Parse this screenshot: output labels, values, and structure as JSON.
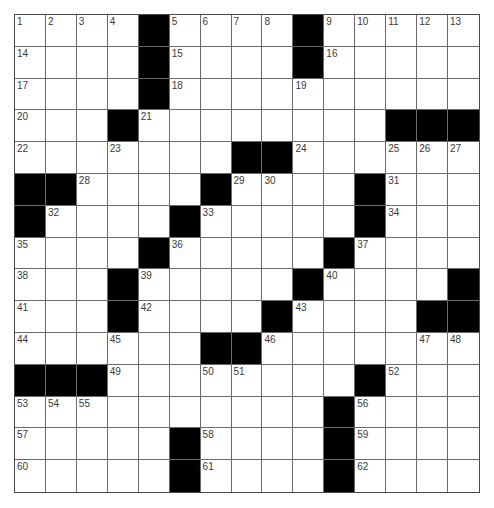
{
  "puzzle": {
    "type": "crossword",
    "size": {
      "rows": 15,
      "cols": 15
    },
    "colors": {
      "block": "#000000",
      "cell": "#ffffff",
      "gridline": "#6b6b6b",
      "number": "#3a3a3a"
    },
    "layout": [
      "....#....#.....",
      "....#....#.....",
      "....#..........",
      "...#........###",
      ".......##......",
      "##....#....#...",
      "#....#.....#...",
      "....#.....#....",
      "...#.....#....#",
      "...#....#....##",
      "......##.......",
      "###........#...",
      "..........#....",
      ".....#....#....",
      ".....#....#...."
    ],
    "numbers": [
      {
        "row": 0,
        "col": 0,
        "n": "1"
      },
      {
        "row": 0,
        "col": 1,
        "n": "2"
      },
      {
        "row": 0,
        "col": 2,
        "n": "3"
      },
      {
        "row": 0,
        "col": 3,
        "n": "4"
      },
      {
        "row": 0,
        "col": 5,
        "n": "5"
      },
      {
        "row": 0,
        "col": 6,
        "n": "6"
      },
      {
        "row": 0,
        "col": 7,
        "n": "7"
      },
      {
        "row": 0,
        "col": 8,
        "n": "8"
      },
      {
        "row": 0,
        "col": 10,
        "n": "9"
      },
      {
        "row": 0,
        "col": 11,
        "n": "10"
      },
      {
        "row": 0,
        "col": 12,
        "n": "11"
      },
      {
        "row": 0,
        "col": 13,
        "n": "12"
      },
      {
        "row": 0,
        "col": 14,
        "n": "13"
      },
      {
        "row": 1,
        "col": 0,
        "n": "14"
      },
      {
        "row": 1,
        "col": 5,
        "n": "15"
      },
      {
        "row": 1,
        "col": 10,
        "n": "16"
      },
      {
        "row": 2,
        "col": 0,
        "n": "17"
      },
      {
        "row": 2,
        "col": 5,
        "n": "18"
      },
      {
        "row": 2,
        "col": 9,
        "n": "19"
      },
      {
        "row": 3,
        "col": 0,
        "n": "20"
      },
      {
        "row": 3,
        "col": 4,
        "n": "21"
      },
      {
        "row": 4,
        "col": 0,
        "n": "22"
      },
      {
        "row": 4,
        "col": 3,
        "n": "23"
      },
      {
        "row": 4,
        "col": 9,
        "n": "24"
      },
      {
        "row": 4,
        "col": 12,
        "n": "25"
      },
      {
        "row": 4,
        "col": 13,
        "n": "26"
      },
      {
        "row": 4,
        "col": 14,
        "n": "27"
      },
      {
        "row": 5,
        "col": 2,
        "n": "28"
      },
      {
        "row": 5,
        "col": 7,
        "n": "29"
      },
      {
        "row": 5,
        "col": 8,
        "n": "30"
      },
      {
        "row": 5,
        "col": 12,
        "n": "31"
      },
      {
        "row": 6,
        "col": 1,
        "n": "32"
      },
      {
        "row": 6,
        "col": 6,
        "n": "33"
      },
      {
        "row": 6,
        "col": 12,
        "n": "34"
      },
      {
        "row": 7,
        "col": 0,
        "n": "35"
      },
      {
        "row": 7,
        "col": 5,
        "n": "36"
      },
      {
        "row": 7,
        "col": 11,
        "n": "37"
      },
      {
        "row": 8,
        "col": 0,
        "n": "38"
      },
      {
        "row": 8,
        "col": 4,
        "n": "39"
      },
      {
        "row": 8,
        "col": 10,
        "n": "40"
      },
      {
        "row": 9,
        "col": 0,
        "n": "41"
      },
      {
        "row": 9,
        "col": 4,
        "n": "42"
      },
      {
        "row": 9,
        "col": 9,
        "n": "43"
      },
      {
        "row": 10,
        "col": 0,
        "n": "44"
      },
      {
        "row": 10,
        "col": 3,
        "n": "45"
      },
      {
        "row": 10,
        "col": 8,
        "n": "46"
      },
      {
        "row": 10,
        "col": 13,
        "n": "47"
      },
      {
        "row": 10,
        "col": 14,
        "n": "48"
      },
      {
        "row": 11,
        "col": 3,
        "n": "49"
      },
      {
        "row": 11,
        "col": 6,
        "n": "50"
      },
      {
        "row": 11,
        "col": 7,
        "n": "51"
      },
      {
        "row": 11,
        "col": 12,
        "n": "52"
      },
      {
        "row": 12,
        "col": 0,
        "n": "53"
      },
      {
        "row": 12,
        "col": 1,
        "n": "54"
      },
      {
        "row": 12,
        "col": 2,
        "n": "55"
      },
      {
        "row": 12,
        "col": 11,
        "n": "56"
      },
      {
        "row": 13,
        "col": 0,
        "n": "57"
      },
      {
        "row": 13,
        "col": 6,
        "n": "58"
      },
      {
        "row": 13,
        "col": 11,
        "n": "59"
      },
      {
        "row": 14,
        "col": 0,
        "n": "60"
      },
      {
        "row": 14,
        "col": 6,
        "n": "61"
      },
      {
        "row": 14,
        "col": 11,
        "n": "62"
      }
    ],
    "entries": []
  }
}
